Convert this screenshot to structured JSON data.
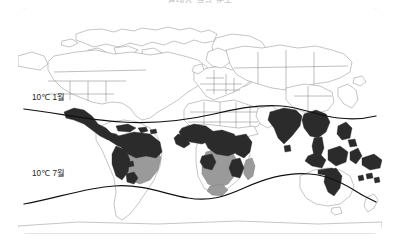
{
  "title": "열대성 질병 분포",
  "figure": {
    "type": "thematic-world-map",
    "frame": {
      "border_color": "#e2e3e6",
      "background": "#ffffff"
    },
    "isotherms": [
      {
        "id": "january",
        "label": "10℃ 1월",
        "temperature_c": 10,
        "month": "1월",
        "label_x": 14,
        "label_y": 92
      },
      {
        "id": "july",
        "label": "10℃ 7월",
        "temperature_c": 10,
        "month": "7월",
        "label_x": 14,
        "label_y": 168
      }
    ],
    "shading": {
      "dark": {
        "color": "#2b2b2b",
        "meaning": "high"
      },
      "mid": {
        "color": "#9a9a9a",
        "meaning": "medium"
      },
      "light": {
        "color": "#ffffff",
        "meaning": "none"
      },
      "outline": {
        "color": "#8a8a8a"
      }
    },
    "regions": [
      {
        "name": "north-america",
        "level": "light"
      },
      {
        "name": "greenland",
        "level": "light"
      },
      {
        "name": "central-america",
        "level": "dark"
      },
      {
        "name": "caribbean",
        "level": "dark"
      },
      {
        "name": "northern-south-america",
        "level": "dark"
      },
      {
        "name": "brazil",
        "level": "mid"
      },
      {
        "name": "southern-south-america",
        "level": "light"
      },
      {
        "name": "europe",
        "level": "light"
      },
      {
        "name": "russia",
        "level": "light"
      },
      {
        "name": "west-africa",
        "level": "dark"
      },
      {
        "name": "central-africa",
        "level": "dark"
      },
      {
        "name": "east-africa",
        "level": "dark"
      },
      {
        "name": "southern-africa",
        "level": "mid"
      },
      {
        "name": "north-africa",
        "level": "light"
      },
      {
        "name": "madagascar",
        "level": "mid"
      },
      {
        "name": "india",
        "level": "dark"
      },
      {
        "name": "southeast-asia",
        "level": "dark"
      },
      {
        "name": "indonesia",
        "level": "dark"
      },
      {
        "name": "philippines",
        "level": "dark"
      },
      {
        "name": "papua-new-guinea",
        "level": "dark"
      },
      {
        "name": "northeast-australia",
        "level": "dark"
      },
      {
        "name": "australia",
        "level": "light"
      },
      {
        "name": "china",
        "level": "light"
      },
      {
        "name": "japan",
        "level": "light"
      }
    ]
  }
}
